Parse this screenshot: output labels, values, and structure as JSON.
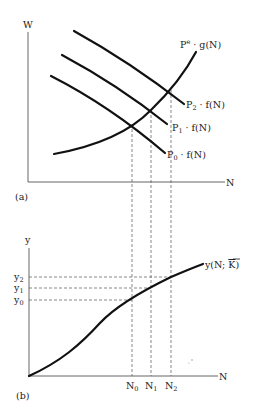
{
  "panel_a": {
    "caption": "(a)",
    "y_axis_label": "W",
    "x_axis_label": "N",
    "curves": [
      {
        "id": "supply",
        "label_main": "P",
        "label_sup": "e",
        "label_rest": " · g(N)"
      },
      {
        "id": "demand_p2",
        "label_main": "P",
        "label_sub": "2",
        "label_rest": " · f(N)"
      },
      {
        "id": "demand_p1",
        "label_main": "P",
        "label_sub": "1",
        "label_rest": " · f(N)"
      },
      {
        "id": "demand_p0",
        "label_main": "P",
        "label_sub": "0",
        "label_rest": " · f(N)"
      }
    ]
  },
  "panel_b": {
    "caption": "(b)",
    "y_axis_label": "y",
    "x_axis_label": "N",
    "curve_label_main": "y(N; ",
    "curve_label_bar": "K",
    "curve_label_end": ")",
    "y_ticks": [
      {
        "main": "y",
        "sub": "2"
      },
      {
        "main": "y",
        "sub": "1"
      },
      {
        "main": "y",
        "sub": "0"
      }
    ],
    "x_ticks": [
      {
        "main": "N",
        "sub": "0"
      },
      {
        "main": "N",
        "sub": "1"
      },
      {
        "main": "N",
        "sub": "2"
      }
    ]
  },
  "colors": {
    "curve": "#111111",
    "axis": "#555555",
    "background": "#ffffff"
  }
}
